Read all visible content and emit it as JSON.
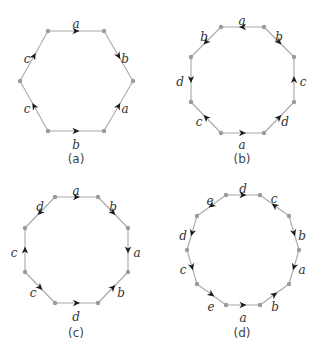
{
  "colors": {
    "edge": "#a8a8a8",
    "vertex": "#9a9a9a",
    "arrow": "#1a1a1a",
    "label": "#333333",
    "background": "#ffffff"
  },
  "polygons": [
    {
      "caption": "(a)",
      "caption_pos": [
        76,
        159
      ],
      "vertices": [
        [
          48,
          31
        ],
        [
          104,
          31
        ],
        [
          133,
          81
        ],
        [
          104,
          131
        ],
        [
          48,
          131
        ],
        [
          20,
          81
        ]
      ],
      "edges": [
        {
          "from": 0,
          "to": 1,
          "label": "a",
          "dir": "forward",
          "label_pos": [
            76,
            24
          ]
        },
        {
          "from": 1,
          "to": 2,
          "label": "b",
          "dir": "forward",
          "label_pos": [
            125,
            59
          ]
        },
        {
          "from": 2,
          "to": 3,
          "label": "a",
          "dir": "backward",
          "label_pos": [
            125,
            109
          ]
        },
        {
          "from": 3,
          "to": 4,
          "label": "b",
          "dir": "backward",
          "label_pos": [
            76,
            145
          ]
        },
        {
          "from": 4,
          "to": 5,
          "label": "c",
          "dir": "forward",
          "label_pos": [
            27,
            109
          ]
        },
        {
          "from": 5,
          "to": 0,
          "label": "c",
          "dir": "forward",
          "label_pos": [
            27,
            59
          ]
        }
      ]
    },
    {
      "caption": "(b)",
      "caption_pos": [
        242,
        159
      ],
      "vertices": [
        [
          221,
          27
        ],
        [
          264,
          27
        ],
        [
          294,
          57
        ],
        [
          294,
          102
        ],
        [
          264,
          133
        ],
        [
          221,
          133
        ],
        [
          191,
          102
        ],
        [
          191,
          57
        ]
      ],
      "edges": [
        {
          "from": 0,
          "to": 1,
          "label": "a",
          "dir": "backward",
          "label_pos": [
            242,
            21
          ]
        },
        {
          "from": 1,
          "to": 2,
          "label": "b",
          "dir": "forward",
          "label_pos": [
            279,
            37
          ]
        },
        {
          "from": 2,
          "to": 3,
          "label": "c",
          "dir": "backward",
          "label_pos": [
            303,
            82
          ]
        },
        {
          "from": 3,
          "to": 4,
          "label": "d",
          "dir": "backward",
          "label_pos": [
            285,
            122
          ]
        },
        {
          "from": 4,
          "to": 5,
          "label": "a",
          "dir": "backward",
          "label_pos": [
            242,
            145
          ]
        },
        {
          "from": 5,
          "to": 6,
          "label": "c",
          "dir": "forward",
          "label_pos": [
            199,
            122
          ]
        },
        {
          "from": 6,
          "to": 7,
          "label": "d",
          "dir": "backward",
          "label_pos": [
            180,
            82
          ]
        },
        {
          "from": 7,
          "to": 0,
          "label": "b",
          "dir": "backward",
          "label_pos": [
            204,
            37
          ]
        }
      ]
    },
    {
      "caption": "(c)",
      "caption_pos": [
        76,
        333
      ],
      "vertices": [
        [
          55,
          197
        ],
        [
          98,
          197
        ],
        [
          128,
          228
        ],
        [
          128,
          272
        ],
        [
          98,
          303
        ],
        [
          55,
          303
        ],
        [
          25,
          272
        ],
        [
          25,
          228
        ]
      ],
      "edges": [
        {
          "from": 0,
          "to": 1,
          "label": "a",
          "dir": "forward",
          "label_pos": [
            76,
            191
          ]
        },
        {
          "from": 1,
          "to": 2,
          "label": "b",
          "dir": "forward",
          "label_pos": [
            113,
            207
          ]
        },
        {
          "from": 2,
          "to": 3,
          "label": "a",
          "dir": "forward",
          "label_pos": [
            137,
            253
          ]
        },
        {
          "from": 3,
          "to": 4,
          "label": "b",
          "dir": "backward",
          "label_pos": [
            121,
            293
          ]
        },
        {
          "from": 4,
          "to": 5,
          "label": "d",
          "dir": "backward",
          "label_pos": [
            76,
            317
          ]
        },
        {
          "from": 5,
          "to": 6,
          "label": "c",
          "dir": "backward",
          "label_pos": [
            33,
            293
          ]
        },
        {
          "from": 6,
          "to": 7,
          "label": "c",
          "dir": "forward",
          "label_pos": [
            14,
            253
          ]
        },
        {
          "from": 7,
          "to": 0,
          "label": "d",
          "dir": "backward",
          "label_pos": [
            40,
            207
          ]
        }
      ]
    },
    {
      "caption": "(d)",
      "caption_pos": [
        242,
        333
      ],
      "vertices": [
        [
          226,
          195
        ],
        [
          260,
          195
        ],
        [
          289,
          216
        ],
        [
          299,
          250
        ],
        [
          289,
          284
        ],
        [
          260,
          305
        ],
        [
          226,
          305
        ],
        [
          197,
          284
        ],
        [
          187,
          250
        ],
        [
          197,
          216
        ]
      ],
      "edges": [
        {
          "from": 0,
          "to": 1,
          "label": "d",
          "dir": "forward",
          "label_pos": [
            243,
            189
          ]
        },
        {
          "from": 1,
          "to": 2,
          "label": "c",
          "dir": "backward",
          "label_pos": [
            274,
            199
          ]
        },
        {
          "from": 2,
          "to": 3,
          "label": "b",
          "dir": "forward",
          "label_pos": [
            302,
            236
          ]
        },
        {
          "from": 3,
          "to": 4,
          "label": "a",
          "dir": "forward",
          "label_pos": [
            302,
            270
          ]
        },
        {
          "from": 4,
          "to": 5,
          "label": "b",
          "dir": "backward",
          "label_pos": [
            275,
            307
          ]
        },
        {
          "from": 5,
          "to": 6,
          "label": "a",
          "dir": "backward",
          "label_pos": [
            243,
            318
          ]
        },
        {
          "from": 6,
          "to": 7,
          "label": "e",
          "dir": "backward",
          "label_pos": [
            211,
            307
          ]
        },
        {
          "from": 7,
          "to": 8,
          "label": "c",
          "dir": "backward",
          "label_pos": [
            183,
            270
          ]
        },
        {
          "from": 8,
          "to": 9,
          "label": "d",
          "dir": "backward",
          "label_pos": [
            183,
            236
          ]
        },
        {
          "from": 9,
          "to": 0,
          "label": "e",
          "dir": "backward",
          "label_pos": [
            210,
            201
          ]
        }
      ]
    }
  ]
}
